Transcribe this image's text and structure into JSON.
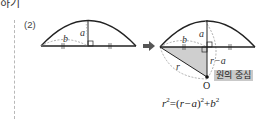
{
  "header": {
    "fragment": "하기"
  },
  "problem": {
    "number": "(2)"
  },
  "left_diagram": {
    "labels": {
      "height": "a",
      "half_chord": "b"
    }
  },
  "arrow": {
    "glyph": "➡"
  },
  "right_diagram": {
    "labels": {
      "height": "a",
      "half_chord": "b",
      "radius": "r",
      "remaining": "r−a",
      "center_point": "O"
    },
    "center_label": "원의 중심",
    "colors": {
      "triangle_fill": "#cfcfcf",
      "label_bg": "#c9c9c9",
      "line": "#222222",
      "dash": "#999999"
    }
  },
  "formula": {
    "lhs_var": "r",
    "lhs_exp": "2",
    "eq": "=",
    "paren_open": "(",
    "inner": "r−a",
    "paren_close": ")",
    "inner_exp": "2",
    "plus": "+",
    "rhs_var": "b",
    "rhs_exp": "2"
  }
}
